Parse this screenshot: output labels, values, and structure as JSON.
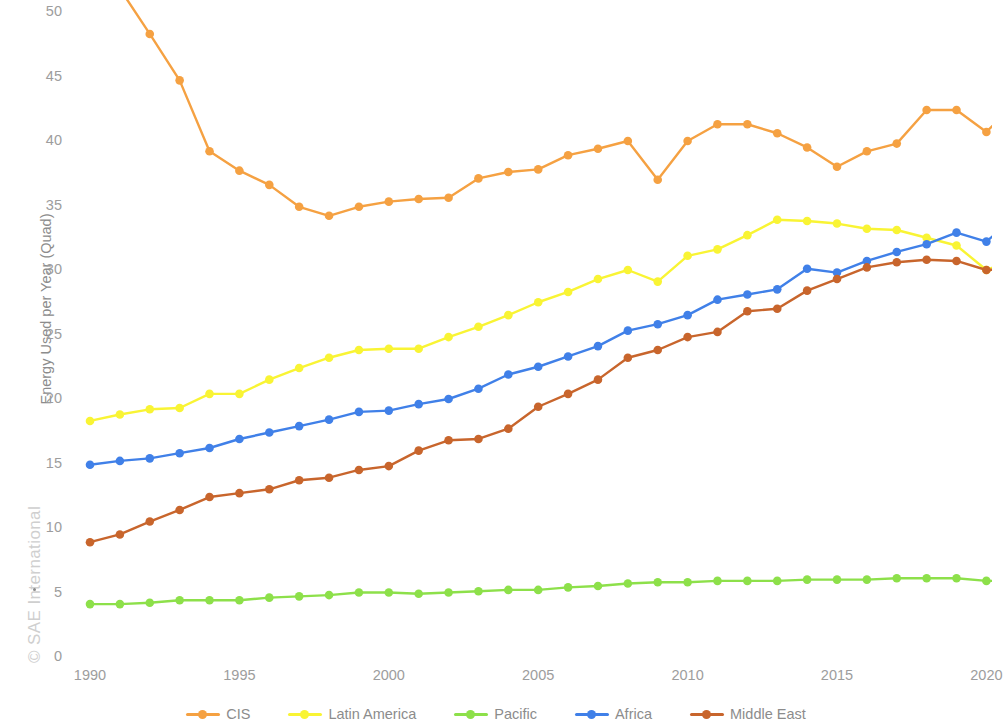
{
  "watermark": {
    "text": "© SAE International"
  },
  "axes": {
    "y_title": "Energy Used per Year (Quad)",
    "x_title": "",
    "y_ticks": [
      "0",
      "5",
      "10",
      "15",
      "20",
      "25",
      "30",
      "35",
      "40",
      "45",
      "50"
    ],
    "x_ticks": [
      "1990",
      "1995",
      "2000",
      "2005",
      "2010",
      "2015",
      "2020"
    ]
  },
  "legend": {
    "items": [
      {
        "label": "CIS",
        "color": "#f5a142"
      },
      {
        "label": "Latin America",
        "color": "#f9f434"
      },
      {
        "label": "Pacific",
        "color": "#8de04a"
      },
      {
        "label": "Africa",
        "color": "#4080e8"
      },
      {
        "label": "Middle East",
        "color": "#c8652c"
      }
    ]
  },
  "chart_data": {
    "type": "line",
    "title": "",
    "xlabel": "",
    "ylabel": "Energy Used per Year (Quad)",
    "xlim": [
      1990,
      2021
    ],
    "ylim": [
      0,
      50
    ],
    "grid": false,
    "legend_position": "bottom",
    "x": [
      1990,
      1991,
      1992,
      1993,
      1994,
      1995,
      1996,
      1997,
      1998,
      1999,
      2000,
      2001,
      2002,
      2003,
      2004,
      2005,
      2006,
      2007,
      2008,
      2009,
      2010,
      2011,
      2012,
      2013,
      2014,
      2015,
      2016,
      2017,
      2018,
      2019,
      2020,
      2021
    ],
    "series": [
      {
        "name": "CIS",
        "color": "#f5a142",
        "values": [
          55.0,
          51.8,
          48.3,
          44.7,
          39.2,
          37.7,
          36.6,
          34.9,
          34.2,
          34.9,
          35.3,
          35.5,
          35.6,
          37.1,
          37.6,
          37.8,
          38.9,
          39.4,
          40.0,
          37.0,
          40.0,
          41.3,
          41.3,
          40.6,
          39.5,
          38.0,
          39.2,
          39.8,
          42.4,
          42.4,
          40.7,
          43.0
        ]
      },
      {
        "name": "Latin America",
        "color": "#f9f434",
        "values": [
          18.3,
          18.8,
          19.2,
          19.3,
          20.4,
          20.4,
          21.5,
          22.4,
          23.2,
          23.8,
          23.9,
          23.9,
          24.8,
          25.6,
          26.5,
          27.5,
          28.3,
          29.3,
          30.0,
          29.1,
          31.1,
          31.6,
          32.7,
          33.9,
          33.8,
          33.6,
          33.2,
          33.1,
          32.5,
          31.9,
          30.0,
          30.9
        ]
      },
      {
        "name": "Pacific",
        "color": "#8de04a",
        "values": [
          4.1,
          4.1,
          4.2,
          4.4,
          4.4,
          4.4,
          4.6,
          4.7,
          4.8,
          5.0,
          5.0,
          4.9,
          5.0,
          5.1,
          5.2,
          5.2,
          5.4,
          5.5,
          5.7,
          5.8,
          5.8,
          5.9,
          5.9,
          5.9,
          6.0,
          6.0,
          6.0,
          6.1,
          6.1,
          6.1,
          5.9,
          5.9
        ]
      },
      {
        "name": "Africa",
        "color": "#4080e8",
        "values": [
          14.9,
          15.2,
          15.4,
          15.8,
          16.2,
          16.9,
          17.4,
          17.9,
          18.4,
          19.0,
          19.1,
          19.6,
          20.0,
          20.8,
          21.9,
          22.5,
          23.3,
          24.1,
          25.3,
          25.8,
          26.5,
          27.7,
          28.1,
          28.5,
          30.1,
          29.8,
          30.7,
          31.4,
          32.0,
          32.9,
          32.2,
          34.2
        ]
      },
      {
        "name": "Middle East",
        "color": "#c8652c",
        "values": [
          8.9,
          9.5,
          10.5,
          11.4,
          12.4,
          12.7,
          13.0,
          13.7,
          13.9,
          14.5,
          14.8,
          16.0,
          16.8,
          16.9,
          17.7,
          19.4,
          20.4,
          21.5,
          23.2,
          23.8,
          24.8,
          25.2,
          26.8,
          27.0,
          28.4,
          29.3,
          30.2,
          30.6,
          30.8,
          30.7,
          30.0,
          30.1
        ]
      }
    ]
  }
}
